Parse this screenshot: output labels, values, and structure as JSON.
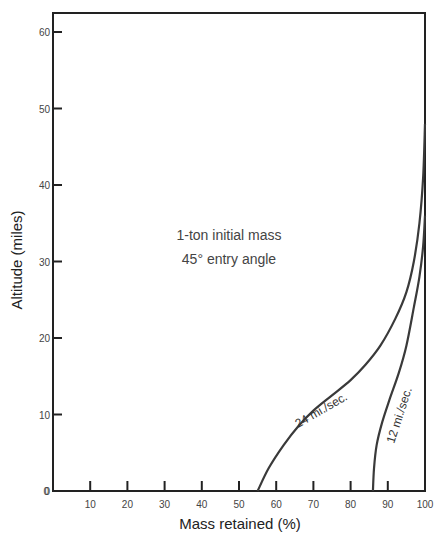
{
  "chart_data": {
    "type": "line",
    "title": "",
    "xlabel": "Mass retained (%)",
    "ylabel": "Altitude (miles)",
    "xlim": [
      0,
      100
    ],
    "ylim": [
      0,
      62
    ],
    "x_ticks": [
      10,
      20,
      30,
      40,
      50,
      60,
      70,
      80,
      90,
      100
    ],
    "y_ticks": [
      0,
      10,
      20,
      30,
      40,
      50,
      60
    ],
    "grid": false,
    "annotations": [
      "1-ton initial mass",
      "45° entry angle"
    ],
    "series": [
      {
        "name": "24 mi./sec.",
        "x": [
          55,
          58,
          62,
          66,
          70,
          75,
          80,
          84,
          88,
          92,
          95,
          97,
          98.5,
          99.5,
          100
        ],
        "y": [
          0,
          3,
          6,
          8.5,
          10.5,
          12.5,
          14.5,
          16.5,
          19,
          22.5,
          26,
          30,
          35,
          41,
          48
        ]
      },
      {
        "name": "12 mi./sec.",
        "x": [
          86,
          86.3,
          87,
          88.5,
          90.5,
          93,
          95,
          97,
          98.5,
          99.5,
          100
        ],
        "y": [
          0,
          3,
          6,
          9,
          12,
          15.5,
          19,
          24,
          28,
          32,
          36
        ]
      }
    ]
  },
  "labels": {
    "annotation_line1": "1-ton initial mass",
    "annotation_line2": "45° entry angle",
    "xlabel": "Mass retained (%)",
    "ylabel": "Altitude (miles)",
    "series1_label": "24 mi./sec.",
    "series2_label": "12 mi./sec."
  },
  "colors": {
    "axis": "#222222",
    "curve": "#3a3a3a",
    "text": "#444444"
  }
}
